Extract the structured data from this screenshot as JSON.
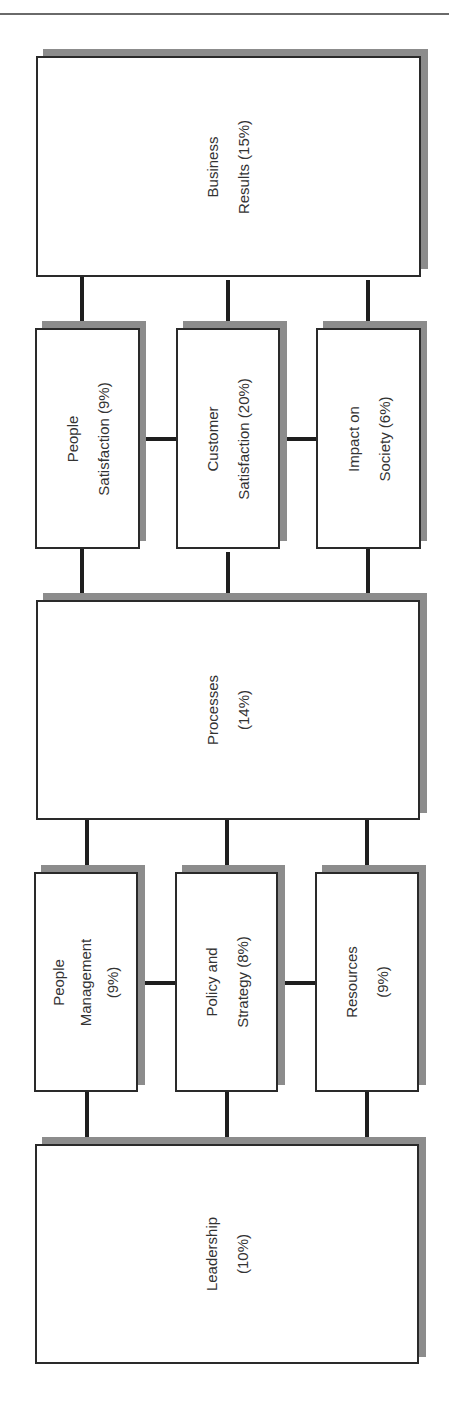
{
  "diagram": {
    "type": "EFQM Excellence Model",
    "orientation": "rotated 90 degrees (text reads bottom-to-top)",
    "colors": {
      "border": "#2a2a2a",
      "shadow": "#8c8c8c",
      "text": "#333333",
      "connector": "#1e1e1e"
    },
    "boxes": {
      "business_results": {
        "line1": "Business",
        "line2": "Results (15%)",
        "text": "Business\nResults (15%)"
      },
      "people_satisfaction": {
        "text": "People\nSatisfaction (9%)"
      },
      "customer_satisfaction": {
        "text": "Customer\nSatisfaction (20%)"
      },
      "impact_on_society": {
        "text": "Impact on\nSociety (6%)"
      },
      "processes": {
        "text": "Processes\n(14%)"
      },
      "people_management": {
        "text": "People\nManagement\n(9%)"
      },
      "policy_and_strategy": {
        "text": "Policy and\nStrategy (8%)"
      },
      "resources": {
        "text": "Resources\n(9%)"
      },
      "leadership": {
        "text": "Leadership\n(10%)"
      }
    }
  }
}
